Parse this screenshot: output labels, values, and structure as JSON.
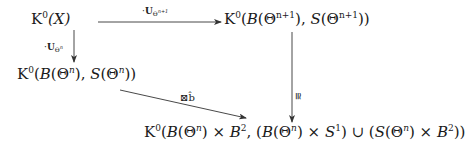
{
  "diagram": {
    "type": "commutative-diagram",
    "nodes": {
      "top_left": {
        "text": "K⁰(X)",
        "base": "K",
        "sup": "0",
        "arg": "(X)"
      },
      "top_right": {
        "text": "K⁰(B(Θⁿ⁺¹), S(Θⁿ⁺¹))",
        "base": "K",
        "sup": "0",
        "p1": "(",
        "B": "B",
        "p2": "(Θ",
        "exp1": "n+1",
        "p3": "), ",
        "S": "S",
        "p4": "(Θ",
        "exp2": "n+1",
        "p5": "))"
      },
      "mid_left": {
        "text": "K⁰(B(Θⁿ), S(Θⁿ))",
        "base": "K",
        "sup": "0",
        "p1": "(",
        "B": "B",
        "p2": "(Θ",
        "exp1": "n",
        "p3": "), ",
        "S": "S",
        "p4": "(Θ",
        "exp2": "n",
        "p5": "))"
      },
      "bottom": {
        "text": "K⁰(B(Θⁿ) × B², (B(Θⁿ) × S¹) ∪ (S(Θⁿ) × B²))",
        "base": "K",
        "sup": "0",
        "s1": "(",
        "B1": "B",
        "s2": "(Θ",
        "e1": "n",
        "s3": ") × ",
        "B2": "B",
        "e2": "2",
        "s4": ", (",
        "B3": "B",
        "s5": "(Θ",
        "e3": "n",
        "s6": ") × ",
        "S1": "S",
        "e4": "1",
        "s7": ") ∪ (",
        "S2": "S",
        "s8": "(Θ",
        "e5": "n",
        "s9": ") × ",
        "B4": "B",
        "e6": "2",
        "s10": "))"
      }
    },
    "arrows": {
      "top": {
        "from": "top_left",
        "to": "top_right",
        "label_dot": "·",
        "label_U": "U",
        "label_sub": "Θ",
        "label_subsup": "n+1"
      },
      "left": {
        "from": "top_left",
        "to": "mid_left",
        "label_dot": "·",
        "label_U": "U",
        "label_sub": "Θ",
        "label_subsup": "n"
      },
      "diag": {
        "from": "mid_left",
        "to": "bottom",
        "label": "⊠b̂"
      },
      "right": {
        "from": "top_right",
        "to": "bottom",
        "label": "≅"
      }
    }
  }
}
